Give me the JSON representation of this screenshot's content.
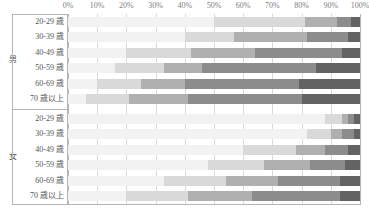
{
  "chart_data": {
    "type": "bar",
    "subtype": "stacked-horizontal-100pct",
    "title": "",
    "xlabel": "",
    "ylabel": "",
    "xlim": [
      0,
      100
    ],
    "grid": true,
    "legend": "none",
    "axis": {
      "ticks": [
        0,
        10,
        20,
        30,
        40,
        50,
        60,
        70,
        80,
        90,
        100
      ],
      "tick_labels": [
        "0%",
        "10%",
        "20%",
        "30%",
        "40%",
        "50%",
        "60%",
        "70%",
        "80%",
        "90%",
        "100%"
      ]
    },
    "groups": [
      {
        "name": "男",
        "categories": [
          "20-29 歳",
          "30-39 歳",
          "40-49 歳",
          "50-59 歳",
          "60-69 歳",
          "70 歳以上"
        ]
      },
      {
        "name": "女",
        "categories": [
          "20-29 歳",
          "30-39 歳",
          "40-49 歳",
          "50-59 歳",
          "60-69 歳",
          "70 歳以上"
        ]
      }
    ],
    "series": [
      {
        "name": "seg1",
        "color": "#f2f2f2",
        "values": [
          50,
          40,
          20,
          16,
          10,
          6,
          88,
          82,
          60,
          48,
          33,
          20
        ]
      },
      {
        "name": "seg2",
        "color": "#d9d9d9",
        "values": [
          31,
          17,
          22,
          17,
          15,
          15,
          6,
          8,
          18,
          19,
          21,
          21
        ]
      },
      {
        "name": "seg3",
        "color": "#b0b0b0",
        "values": [
          11,
          25,
          22,
          13,
          15,
          20,
          2,
          4,
          10,
          16,
          18,
          22
        ]
      },
      {
        "name": "seg4",
        "color": "#8c8c8c",
        "values": [
          5,
          14,
          30,
          39,
          39,
          39,
          2,
          4,
          8,
          12,
          21,
          30
        ]
      },
      {
        "name": "seg5",
        "color": "#636363",
        "values": [
          3,
          4,
          6,
          15,
          21,
          20,
          2,
          2,
          4,
          5,
          7,
          7
        ]
      }
    ],
    "rows": [
      {
        "group": "男",
        "category": "20-29 歳",
        "values": [
          50,
          31,
          11,
          5,
          3
        ]
      },
      {
        "group": "男",
        "category": "30-39 歳",
        "values": [
          40,
          17,
          25,
          14,
          4
        ]
      },
      {
        "group": "男",
        "category": "40-49 歳",
        "values": [
          20,
          22,
          22,
          30,
          6
        ]
      },
      {
        "group": "男",
        "category": "50-59 歳",
        "values": [
          16,
          17,
          13,
          39,
          15
        ]
      },
      {
        "group": "男",
        "category": "60-69 歳",
        "values": [
          10,
          15,
          15,
          39,
          21
        ]
      },
      {
        "group": "男",
        "category": "70 歳以上",
        "values": [
          6,
          15,
          20,
          39,
          20
        ]
      },
      {
        "group": "女",
        "category": "20-29 歳",
        "values": [
          88,
          6,
          2,
          2,
          2
        ]
      },
      {
        "group": "女",
        "category": "30-39 歳",
        "values": [
          82,
          8,
          4,
          4,
          2
        ]
      },
      {
        "group": "女",
        "category": "40-49 歳",
        "values": [
          60,
          18,
          10,
          8,
          4
        ]
      },
      {
        "group": "女",
        "category": "50-59 歳",
        "values": [
          48,
          19,
          16,
          12,
          5
        ]
      },
      {
        "group": "女",
        "category": "60-69 歳",
        "values": [
          33,
          21,
          18,
          21,
          7
        ]
      },
      {
        "group": "女",
        "category": "70 歳以上",
        "values": [
          20,
          21,
          22,
          30,
          7
        ]
      }
    ],
    "colors": {
      "seg1": "#f2f2f2",
      "seg2": "#d9d9d9",
      "seg3": "#b0b0b0",
      "seg4": "#8c8c8c",
      "seg5": "#636363",
      "grid": "#d9d9d9",
      "frame": "#b5b5b5",
      "text": "#555555",
      "tick_text": "#808080"
    }
  }
}
